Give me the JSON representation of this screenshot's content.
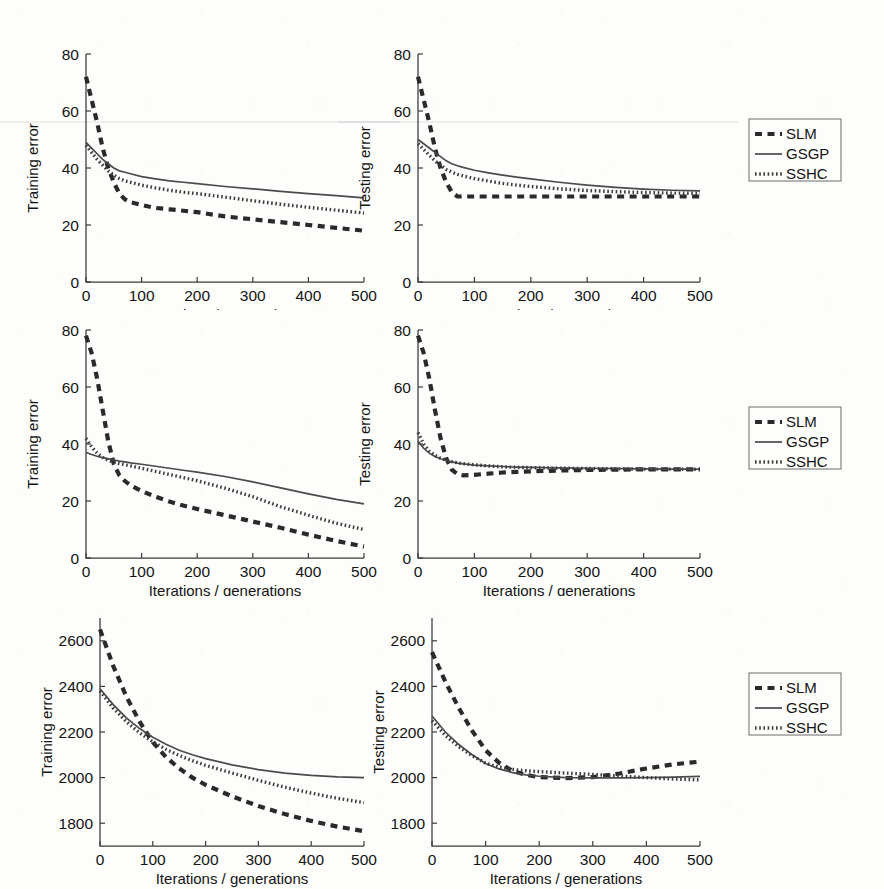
{
  "figure": {
    "layout": "3 rows x 2 columns of line plots with one legend box per row",
    "rows": 3,
    "columns": 2,
    "legend_entries": [
      {
        "label": "SLM",
        "style": "dashed"
      },
      {
        "label": "GSGP",
        "style": "solid"
      },
      {
        "label": "SSHC",
        "style": "dotted"
      }
    ]
  },
  "axis_titles": {
    "x": "Iterations / generations",
    "y_training": "Training error",
    "y_testing": "Testing error"
  },
  "chart_data": [
    {
      "id": "row1-training",
      "type": "line",
      "title": "",
      "xlabel": "Iterations / generations",
      "ylabel": "Training error",
      "xlim": [
        0,
        500
      ],
      "ylim": [
        0,
        80
      ],
      "xticks": [
        0,
        100,
        200,
        300,
        400,
        500
      ],
      "yticks": [
        0,
        20,
        40,
        60,
        80
      ],
      "grid": false,
      "legend_position": "right-outside",
      "x": [
        0,
        10,
        20,
        30,
        40,
        50,
        60,
        70,
        80,
        100,
        125,
        150,
        175,
        200,
        250,
        300,
        350,
        400,
        450,
        500
      ],
      "series": [
        {
          "name": "SLM",
          "style": "dashed",
          "values": [
            72,
            64,
            56,
            47,
            40,
            35,
            31,
            29,
            28,
            27,
            26,
            25.5,
            25,
            24.5,
            23,
            22,
            21,
            20,
            19,
            18
          ]
        },
        {
          "name": "GSGP",
          "style": "solid",
          "values": [
            49,
            47,
            45,
            43,
            41.5,
            40,
            39,
            38.5,
            38,
            37,
            36.2,
            35.5,
            35,
            34.5,
            33.5,
            32.7,
            31.8,
            31,
            30.3,
            29.5
          ]
        },
        {
          "name": "SSHC",
          "style": "dotted",
          "values": [
            48,
            45.5,
            43,
            41,
            39,
            37.5,
            36.3,
            35.5,
            35,
            34,
            33,
            32.2,
            31.5,
            31,
            29.8,
            28.5,
            27.3,
            26.2,
            25.2,
            24.2
          ]
        }
      ]
    },
    {
      "id": "row1-testing",
      "type": "line",
      "title": "",
      "xlabel": "Iterations / generations",
      "ylabel": "Testing error",
      "xlim": [
        0,
        500
      ],
      "ylim": [
        0,
        80
      ],
      "xticks": [
        0,
        100,
        200,
        300,
        400,
        500
      ],
      "yticks": [
        0,
        20,
        40,
        60,
        80
      ],
      "grid": false,
      "legend_position": "right-outside",
      "x": [
        0,
        10,
        20,
        30,
        40,
        50,
        60,
        70,
        80,
        100,
        125,
        150,
        175,
        200,
        250,
        300,
        350,
        400,
        450,
        500
      ],
      "series": [
        {
          "name": "SLM",
          "style": "dashed",
          "values": [
            72,
            64,
            56,
            47,
            40,
            35,
            31.5,
            30,
            30,
            30,
            30,
            30,
            30,
            30,
            30,
            30,
            30,
            30,
            30,
            30
          ]
        },
        {
          "name": "GSGP",
          "style": "solid",
          "values": [
            50,
            48.5,
            47,
            45.5,
            44,
            42.5,
            41.5,
            40.8,
            40.2,
            39.2,
            38.3,
            37.5,
            36.8,
            36.2,
            35,
            34,
            33.2,
            32.6,
            32.2,
            32
          ]
        },
        {
          "name": "SSHC",
          "style": "dotted",
          "values": [
            48.5,
            46.5,
            44.5,
            42.5,
            41,
            39.5,
            38.5,
            37.8,
            37.2,
            36.3,
            35.4,
            34.6,
            34,
            33.5,
            32.7,
            32.1,
            31.7,
            31.4,
            31.2,
            31.1
          ]
        }
      ]
    },
    {
      "id": "row2-training",
      "type": "line",
      "title": "",
      "xlabel": "Iterations / generations",
      "ylabel": "Training error",
      "xlim": [
        0,
        500
      ],
      "ylim": [
        0,
        80
      ],
      "xticks": [
        0,
        100,
        200,
        300,
        400,
        500
      ],
      "yticks": [
        0,
        20,
        40,
        60,
        80
      ],
      "grid": false,
      "legend_position": "right-outside",
      "x": [
        0,
        10,
        20,
        30,
        40,
        50,
        60,
        70,
        80,
        100,
        125,
        150,
        175,
        200,
        250,
        300,
        350,
        400,
        450,
        500
      ],
      "series": [
        {
          "name": "SLM",
          "style": "dashed",
          "values": [
            78,
            72,
            63,
            52,
            41,
            33,
            29,
            27,
            25.5,
            23.5,
            21.5,
            19.8,
            18.4,
            17.2,
            15,
            12.8,
            10.6,
            8.2,
            6,
            4
          ]
        },
        {
          "name": "GSGP",
          "style": "solid",
          "values": [
            37,
            36.3,
            35.7,
            35.2,
            34.8,
            34.4,
            34,
            33.7,
            33.4,
            32.9,
            32.2,
            31.5,
            30.8,
            30.1,
            28.6,
            26.7,
            24.6,
            22.5,
            20.6,
            19
          ]
        },
        {
          "name": "SSHC",
          "style": "dotted",
          "values": [
            42,
            39,
            36.8,
            35.3,
            34.3,
            33.6,
            33.1,
            32.7,
            32.3,
            31.5,
            30.4,
            29.3,
            28.2,
            27.1,
            24.5,
            21.5,
            18,
            15,
            12.2,
            10
          ]
        }
      ]
    },
    {
      "id": "row2-testing",
      "type": "line",
      "title": "",
      "xlabel": "Iterations / generations",
      "ylabel": "Testing error",
      "xlim": [
        0,
        500
      ],
      "ylim": [
        0,
        80
      ],
      "xticks": [
        0,
        100,
        200,
        300,
        400,
        500
      ],
      "yticks": [
        0,
        20,
        40,
        60,
        80
      ],
      "grid": false,
      "legend_position": "right-outside",
      "x": [
        0,
        10,
        20,
        30,
        40,
        50,
        60,
        70,
        80,
        100,
        125,
        150,
        175,
        200,
        250,
        300,
        350,
        400,
        450,
        500
      ],
      "series": [
        {
          "name": "SLM",
          "style": "dashed",
          "values": [
            78,
            72,
            63,
            52,
            42,
            35,
            31,
            29.4,
            29,
            29.2,
            29.6,
            30,
            30.2,
            30.4,
            30.7,
            30.9,
            31,
            31.1,
            31.1,
            31.1
          ]
        },
        {
          "name": "GSGP",
          "style": "solid",
          "values": [
            41,
            38.5,
            36.8,
            35.6,
            34.8,
            34.2,
            33.7,
            33.3,
            33,
            32.6,
            32.3,
            32.1,
            31.9,
            31.8,
            31.6,
            31.5,
            31.4,
            31.3,
            31.2,
            31.2
          ]
        },
        {
          "name": "SSHC",
          "style": "dotted",
          "values": [
            44,
            40,
            37.5,
            36,
            35,
            34.3,
            33.8,
            33.4,
            33.1,
            32.7,
            32.3,
            32,
            31.8,
            31.7,
            31.5,
            31.4,
            31.3,
            31.2,
            31.2,
            31.1
          ]
        }
      ]
    },
    {
      "id": "row3-training",
      "type": "line",
      "title": "",
      "xlabel": "Iterations / generations",
      "ylabel": "Training error",
      "xlim": [
        0,
        500
      ],
      "ylim": [
        1700,
        2700
      ],
      "xticks": [
        0,
        100,
        200,
        300,
        400,
        500
      ],
      "yticks": [
        1800,
        2000,
        2200,
        2400,
        2600
      ],
      "grid": false,
      "legend_position": "right-outside",
      "x": [
        0,
        25,
        50,
        75,
        100,
        125,
        150,
        175,
        200,
        250,
        300,
        350,
        400,
        450,
        500
      ],
      "series": [
        {
          "name": "SLM",
          "style": "dashed",
          "values": [
            2650,
            2490,
            2355,
            2245,
            2155,
            2090,
            2040,
            2000,
            1968,
            1918,
            1875,
            1840,
            1810,
            1785,
            1765
          ]
        },
        {
          "name": "GSGP",
          "style": "solid",
          "values": [
            2390,
            2320,
            2262,
            2215,
            2177,
            2146,
            2120,
            2100,
            2083,
            2056,
            2035,
            2020,
            2010,
            2003,
            2000
          ]
        },
        {
          "name": "SSHC",
          "style": "dotted",
          "values": [
            2380,
            2305,
            2245,
            2196,
            2157,
            2124,
            2097,
            2074,
            2054,
            2020,
            1988,
            1958,
            1932,
            1909,
            1890
          ]
        }
      ]
    },
    {
      "id": "row3-testing",
      "type": "line",
      "title": "",
      "xlabel": "Iterations / generations",
      "ylabel": "Testing error",
      "xlim": [
        0,
        500
      ],
      "ylim": [
        1700,
        2700
      ],
      "xticks": [
        0,
        100,
        200,
        300,
        400,
        500
      ],
      "yticks": [
        1800,
        2000,
        2200,
        2400,
        2600
      ],
      "grid": false,
      "legend_position": "right-outside",
      "x": [
        0,
        25,
        50,
        75,
        100,
        125,
        150,
        175,
        200,
        250,
        300,
        350,
        400,
        450,
        500
      ],
      "series": [
        {
          "name": "SLM",
          "style": "dashed",
          "values": [
            2550,
            2420,
            2305,
            2205,
            2120,
            2065,
            2030,
            2012,
            2002,
            1998,
            2002,
            2018,
            2040,
            2058,
            2070
          ]
        },
        {
          "name": "GSGP",
          "style": "solid",
          "values": [
            2270,
            2200,
            2145,
            2100,
            2062,
            2038,
            2022,
            2012,
            2006,
            2000,
            1999,
            1999,
            2000,
            2002,
            2005
          ]
        },
        {
          "name": "SSHC",
          "style": "dotted",
          "values": [
            2250,
            2185,
            2135,
            2096,
            2063,
            2046,
            2036,
            2030,
            2026,
            2020,
            2014,
            2007,
            2000,
            1994,
            1990
          ]
        }
      ]
    }
  ]
}
